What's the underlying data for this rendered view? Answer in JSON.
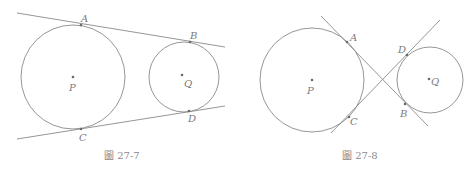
{
  "figures": [
    {
      "caption": "圖 27-7",
      "description": "Two circles with external common tangents",
      "circles": [
        {
          "center_label": "P",
          "cx": 73,
          "cy": 77,
          "r": 52
        },
        {
          "center_label": "Q",
          "cx": 184,
          "cy": 77,
          "r": 35
        }
      ],
      "tangent_lines": [
        {
          "x1": 17,
          "y1": 13,
          "x2": 225,
          "y2": 47,
          "points": [
            "A",
            "B"
          ]
        },
        {
          "x1": 17,
          "y1": 139,
          "x2": 225,
          "y2": 106,
          "points": [
            "C",
            "D"
          ]
        }
      ],
      "points": {
        "A": {
          "x": 81,
          "y": 25,
          "label": "A"
        },
        "B": {
          "x": 190,
          "y": 42,
          "label": "B"
        },
        "C": {
          "x": 81,
          "y": 129,
          "label": "C"
        },
        "D": {
          "x": 189,
          "y": 111,
          "label": "D"
        }
      }
    },
    {
      "caption": "圖 27-8",
      "description": "Two circles with internal common tangents",
      "circles": [
        {
          "center_label": "P",
          "cx": 312,
          "cy": 80,
          "r": 52
        },
        {
          "center_label": "Q",
          "cx": 430,
          "cy": 80,
          "r": 33
        }
      ],
      "tangent_lines": [
        {
          "x1": 321,
          "y1": 16,
          "x2": 428,
          "y2": 126,
          "points": [
            "A",
            "B"
          ]
        },
        {
          "x1": 331,
          "y1": 133,
          "x2": 440,
          "y2": 20,
          "points": [
            "C",
            "D"
          ]
        }
      ],
      "points": {
        "A": {
          "x": 347,
          "y": 42,
          "label": "A"
        },
        "B": {
          "x": 405,
          "y": 104,
          "label": "B"
        },
        "C": {
          "x": 349,
          "y": 117,
          "label": "C"
        },
        "D": {
          "x": 407,
          "y": 55,
          "label": "D"
        }
      }
    }
  ]
}
